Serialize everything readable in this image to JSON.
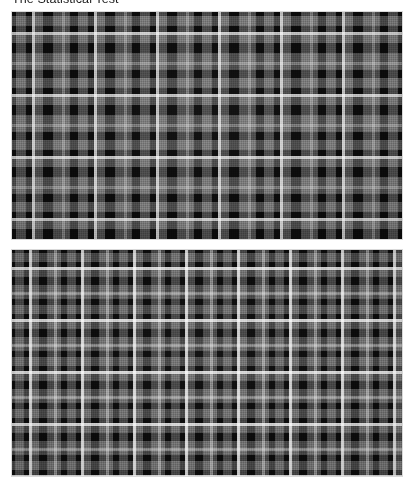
{
  "page": {
    "background_color": "#ffffff",
    "width": 416,
    "height": 489
  },
  "caption": {
    "text": "The Statistical Test",
    "color": "#1b1b1b",
    "truncated": true,
    "note": "clipped by top edge of screenshot"
  },
  "figures": {
    "count": 2,
    "border_color": "#d9d9d9",
    "items": [
      {
        "name": "tartan-pattern-upper",
        "label": "Upper tartan pattern image",
        "pattern_type": "tartan",
        "color_mode": "grayscale",
        "ground_color": "#0b0b0b",
        "highlight_color": "#ffffff",
        "sett_repeat_px": 62,
        "width": 390,
        "height": 227
      },
      {
        "name": "tartan-pattern-lower",
        "label": "Lower tartan pattern image",
        "pattern_type": "tartan",
        "color_mode": "grayscale",
        "ground_color": "#0b0b0b",
        "highlight_color": "#ffffff",
        "sett_repeat_px": 52,
        "width": 390,
        "height": 226
      }
    ]
  }
}
